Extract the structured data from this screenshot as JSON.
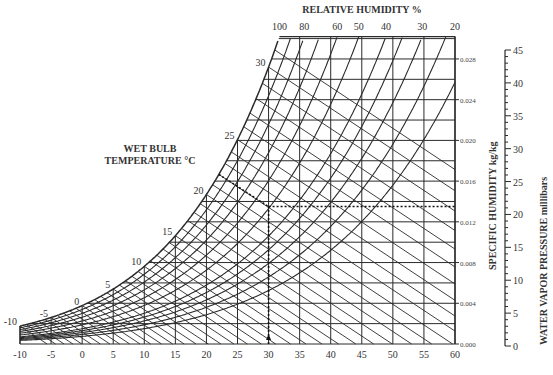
{
  "chart_data": {
    "type": "line",
    "xlabel": "Dry bulb temperature (°C)",
    "x_ticks": [
      -10,
      -5,
      0,
      5,
      10,
      15,
      20,
      25,
      30,
      35,
      40,
      45,
      50,
      55,
      60
    ],
    "xlim": [
      -10,
      60
    ],
    "specific_humidity": {
      "label": "SPECIFIC HUMIDITY kg/kg",
      "ticks": [
        "0.000",
        "0.004",
        "0.008",
        "0.012",
        "0.016",
        "0.020",
        "0.024",
        "0.028"
      ],
      "tick_values": [
        0,
        0.004,
        0.008,
        0.012,
        0.016,
        0.02,
        0.024,
        0.028
      ],
      "ylim": [
        0,
        0.0302
      ],
      "gridline_step": 0.002
    },
    "vapor_pressure": {
      "label": "WATER VAPOR  PRESSURE  millibars",
      "ticks": [
        "0",
        "5",
        "10",
        "15",
        "20",
        "25",
        "30",
        "35",
        "40",
        "45"
      ],
      "tick_values": [
        0,
        5,
        10,
        15,
        20,
        25,
        30,
        35,
        40,
        45
      ],
      "minor_step": 1
    },
    "relative_humidity": {
      "label": "RELATIVE HUMIDITY %",
      "curves": [
        100,
        90,
        80,
        70,
        60,
        50,
        40,
        35,
        30,
        25,
        20
      ],
      "labels": [
        "100",
        "80",
        "60",
        "50",
        "40",
        "30",
        "20"
      ],
      "label_values": [
        100,
        80,
        60,
        50,
        40,
        30,
        20
      ]
    },
    "wet_bulb": {
      "label_line1": "WET BULB",
      "label_line2": "TEMPERATURE  °C",
      "labels": [
        "-10",
        "-5",
        "0",
        "5",
        "10",
        "15",
        "20",
        "25",
        "30"
      ],
      "label_values": [
        -10,
        -5,
        0,
        5,
        10,
        15,
        20,
        25,
        30
      ],
      "line_step": 1,
      "range": [
        -10,
        31
      ]
    },
    "example_path": {
      "dry_bulb": 30,
      "wet_bulb": 22,
      "specific_humidity": 0.0135,
      "style": "dashed"
    },
    "grid": true
  }
}
